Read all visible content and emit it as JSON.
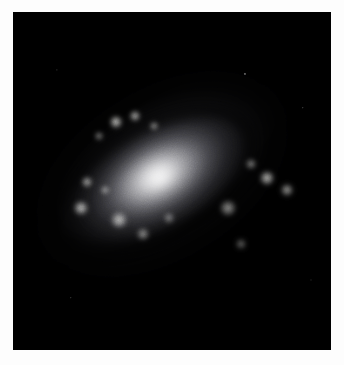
{
  "page": {
    "background_color": "#fdfdfd",
    "width": 344,
    "height": 365
  },
  "figure": {
    "name": "spiral-galaxy-photograph",
    "caption": "",
    "media_type": "astronomical photograph",
    "background_color": "#000000",
    "plate": {
      "x": 13,
      "y": 12,
      "width": 318,
      "height": 338
    }
  },
  "image_content": {
    "palette": {
      "sky": "#000000",
      "outer_halo": "#2a2a2c",
      "arm_dim": "#6a6a6e",
      "arm_bright": "#b9b9bb",
      "bulge": "#e6e6e4",
      "nucleus": "#fdfdfa",
      "dust_lane": "#101012",
      "knot": "#f2f2ee"
    },
    "galaxy": {
      "position_angle_deg": -32,
      "center_x_pct": 47,
      "center_y_pct": 48,
      "major_axis_px": 300,
      "minor_axis_px": 150,
      "core_brightness": 100,
      "arm_count": 2
    },
    "disks": [
      {
        "id": "outer-halo",
        "w": 330,
        "h": 176,
        "rot": -32,
        "dx": 0,
        "dy": 0,
        "core": "rgba(52,52,56,0.95)",
        "mid": "rgba(22,22,25,0.55)",
        "stop1": 48,
        "stop2": 78,
        "blur": 16
      },
      {
        "id": "outer-arm-ring",
        "w": 286,
        "h": 152,
        "rot": -32,
        "dx": -2,
        "dy": 1,
        "core": "rgba(96,96,100,0.95)",
        "mid": "rgba(38,38,42,0.5)",
        "stop1": 46,
        "stop2": 74,
        "blur": 11
      },
      {
        "id": "mid-arm-ring",
        "w": 232,
        "h": 122,
        "rot": -31,
        "dx": -4,
        "dy": 2,
        "core": "rgba(140,140,143,0.95)",
        "mid": "rgba(52,52,56,0.45)",
        "stop1": 44,
        "stop2": 72,
        "blur": 9
      },
      {
        "id": "inner-arm-ring",
        "w": 174,
        "h": 92,
        "rot": -30,
        "dx": -6,
        "dy": 2,
        "core": "rgba(176,176,178,0.95)",
        "mid": "rgba(70,70,74,0.4)",
        "stop1": 42,
        "stop2": 70,
        "blur": 8
      },
      {
        "id": "bulge",
        "w": 112,
        "h": 64,
        "rot": -28,
        "dx": -4,
        "dy": 2,
        "core": "rgba(232,232,230,1)",
        "mid": "rgba(120,120,120,0.35)",
        "stop1": 34,
        "stop2": 70,
        "blur": 7
      },
      {
        "id": "nucleus",
        "w": 62,
        "h": 38,
        "rot": -28,
        "dx": -2,
        "dy": 4,
        "core": "rgba(253,253,250,1)",
        "mid": "rgba(180,180,178,0.3)",
        "stop1": 30,
        "stop2": 72,
        "blur": 5
      }
    ],
    "dust_lanes": [
      {
        "id": "dust-lane-upper",
        "w": 256,
        "h": 128,
        "rot": -32,
        "dx": 4,
        "dy": -14,
        "thickness": 9,
        "opacity": 0.85
      },
      {
        "id": "dust-lane-lower",
        "w": 214,
        "h": 106,
        "rot": -31,
        "dx": -10,
        "dy": 12,
        "thickness": 8,
        "opacity": 0.78
      },
      {
        "id": "dust-lane-outer",
        "w": 300,
        "h": 154,
        "rot": -32,
        "dx": 2,
        "dy": -6,
        "thickness": 7,
        "opacity": 0.6
      }
    ],
    "hii_knots": [
      {
        "id": "knot-ul-1",
        "x": 103,
        "y": 110,
        "r": 7,
        "i": 0.85
      },
      {
        "id": "knot-ul-2",
        "x": 122,
        "y": 104,
        "r": 6,
        "i": 0.78
      },
      {
        "id": "knot-ul-3",
        "x": 141,
        "y": 114,
        "r": 5,
        "i": 0.62
      },
      {
        "id": "knot-ul-4",
        "x": 86,
        "y": 124,
        "r": 5,
        "i": 0.55
      },
      {
        "id": "knot-l-1",
        "x": 74,
        "y": 170,
        "r": 6,
        "i": 0.72
      },
      {
        "id": "knot-l-2",
        "x": 92,
        "y": 178,
        "r": 5,
        "i": 0.6
      },
      {
        "id": "knot-l-3",
        "x": 68,
        "y": 196,
        "r": 8,
        "i": 0.8
      },
      {
        "id": "knot-l-4",
        "x": 106,
        "y": 208,
        "r": 9,
        "i": 0.76
      },
      {
        "id": "knot-l-5",
        "x": 130,
        "y": 222,
        "r": 7,
        "i": 0.58
      },
      {
        "id": "knot-c-1",
        "x": 156,
        "y": 206,
        "r": 6,
        "i": 0.5
      },
      {
        "id": "knot-r-1",
        "x": 254,
        "y": 166,
        "r": 8,
        "i": 0.78
      },
      {
        "id": "knot-r-2",
        "x": 274,
        "y": 178,
        "r": 7,
        "i": 0.66
      },
      {
        "id": "knot-r-3",
        "x": 238,
        "y": 152,
        "r": 6,
        "i": 0.55
      },
      {
        "id": "knot-r-4",
        "x": 215,
        "y": 196,
        "r": 9,
        "i": 0.6
      },
      {
        "id": "knot-br-1",
        "x": 228,
        "y": 232,
        "r": 6,
        "i": 0.42
      }
    ],
    "field_stars": [
      {
        "id": "star-1",
        "x": 232,
        "y": 62,
        "r": 1.6,
        "i": 0.55
      },
      {
        "id": "star-2",
        "x": 290,
        "y": 96,
        "r": 1.2,
        "i": 0.4
      },
      {
        "id": "star-3",
        "x": 58,
        "y": 286,
        "r": 1.2,
        "i": 0.35
      },
      {
        "id": "star-4",
        "x": 298,
        "y": 268,
        "r": 1.0,
        "i": 0.3
      },
      {
        "id": "star-5",
        "x": 44,
        "y": 58,
        "r": 1.1,
        "i": 0.3
      }
    ]
  }
}
